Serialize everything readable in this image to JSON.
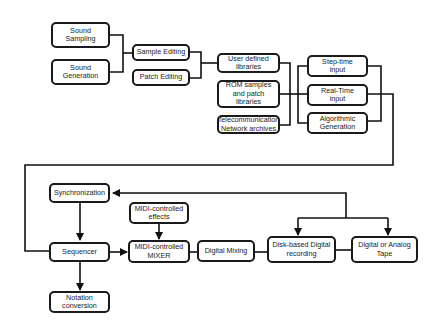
{
  "diagram": {
    "nodes": [
      {
        "id": "sound-sampling",
        "label": "Sound\nSampling"
      },
      {
        "id": "sound-generation",
        "label": "Sound\nGeneration"
      },
      {
        "id": "sample-editing",
        "label": "Sample Editing"
      },
      {
        "id": "patch-editing",
        "label": "Patch Editing"
      },
      {
        "id": "user-libraries",
        "label": "User defined\nlibraries"
      },
      {
        "id": "rom-samples",
        "label": "ROM samples\nand patch\nlibraries"
      },
      {
        "id": "telecom-archives",
        "label": "Telecommunication\nNetwork archives"
      },
      {
        "id": "step-time",
        "label": "Step-time\ninput"
      },
      {
        "id": "real-time",
        "label": "Real-Time\ninput"
      },
      {
        "id": "algorithmic",
        "label": "Algorithmic\nGeneration"
      },
      {
        "id": "synchronization",
        "label": "Synchronization"
      },
      {
        "id": "midi-effects",
        "label": "MIDI-controlled\neffects"
      },
      {
        "id": "sequencer",
        "label": "Sequencer"
      },
      {
        "id": "midi-mixer",
        "label": "MIDI-controlled\nMIXER"
      },
      {
        "id": "digital-mixing",
        "label": "Digital Mixing"
      },
      {
        "id": "disk-recording",
        "label": "Disk-based Digital\nrecording"
      },
      {
        "id": "tape",
        "label": "Digital or Analog Tape"
      },
      {
        "id": "notation",
        "label": "Notation\nconversion"
      }
    ],
    "edges": [
      {
        "from": "sound-sampling",
        "to": "sample-editing"
      },
      {
        "from": "sound-generation",
        "to": "sample-editing"
      },
      {
        "from": "sample-editing",
        "to": "user-libraries"
      },
      {
        "from": "patch-editing",
        "to": "user-libraries"
      },
      {
        "from": "user-libraries",
        "to": "real-time"
      },
      {
        "from": "rom-samples",
        "to": "real-time"
      },
      {
        "from": "telecom-archives",
        "to": "real-time"
      },
      {
        "from": "step-time",
        "to": "sequencer"
      },
      {
        "from": "real-time",
        "to": "sequencer"
      },
      {
        "from": "algorithmic",
        "to": "sequencer"
      },
      {
        "from": "synchronization",
        "to": "sequencer",
        "arrow": true
      },
      {
        "from": "sequencer",
        "to": "midi-mixer",
        "arrow": true
      },
      {
        "from": "midi-effects",
        "to": "midi-mixer",
        "arrow": true
      },
      {
        "from": "sequencer",
        "to": "notation",
        "arrow": true
      },
      {
        "from": "midi-mixer",
        "to": "digital-mixing"
      },
      {
        "from": "digital-mixing",
        "to": "disk-recording"
      },
      {
        "from": "disk-recording",
        "to": "tape"
      },
      {
        "from": "sync-bus",
        "to": "synchronization",
        "arrow": true
      },
      {
        "from": "sync-bus",
        "to": "disk-recording",
        "arrow": true
      },
      {
        "from": "sync-bus",
        "to": "tape",
        "arrow": true
      }
    ]
  }
}
